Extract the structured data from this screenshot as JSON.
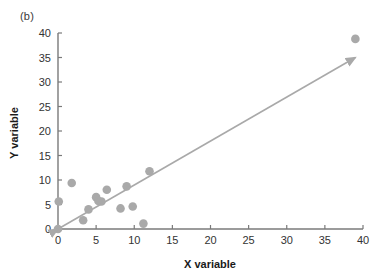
{
  "figure": {
    "panel_label": "(b)"
  },
  "chart_data": {
    "type": "scatter",
    "title": "",
    "xlabel": "X variable",
    "ylabel": "Y variable",
    "xlim": [
      0,
      40
    ],
    "ylim": [
      0,
      40
    ],
    "xticks": [
      0,
      5,
      10,
      15,
      20,
      25,
      30,
      35,
      40
    ],
    "yticks": [
      0,
      5,
      10,
      15,
      20,
      25,
      30,
      35,
      40
    ],
    "xtick_labels": [
      "0",
      "5",
      "10",
      "15",
      "20",
      "25",
      "30",
      "35",
      "40"
    ],
    "ytick_labels": [
      "0",
      "5",
      "10",
      "15",
      "20",
      "25",
      "30",
      "35",
      "40"
    ],
    "grid": false,
    "legend": null,
    "marker_color": "#a9a9a9",
    "line_color": "#a9a9a9",
    "axis_color": "#7a7a7a",
    "points": [
      {
        "x": 0.0,
        "y": 0.0
      },
      {
        "x": 0.1,
        "y": 5.6
      },
      {
        "x": 1.8,
        "y": 9.4
      },
      {
        "x": 3.3,
        "y": 1.8
      },
      {
        "x": 4.0,
        "y": 4.0
      },
      {
        "x": 5.0,
        "y": 6.5
      },
      {
        "x": 5.3,
        "y": 5.7
      },
      {
        "x": 5.7,
        "y": 5.6
      },
      {
        "x": 6.4,
        "y": 8.0
      },
      {
        "x": 8.2,
        "y": 4.2
      },
      {
        "x": 9.0,
        "y": 8.7
      },
      {
        "x": 9.8,
        "y": 4.6
      },
      {
        "x": 11.2,
        "y": 1.1
      },
      {
        "x": 12.0,
        "y": 11.8
      },
      {
        "x": 39.0,
        "y": 38.8
      }
    ],
    "trend_arrow": {
      "x1": 0.0,
      "y1": 0.0,
      "x2": 39.0,
      "y2": 35.0,
      "double_headed": true
    }
  }
}
